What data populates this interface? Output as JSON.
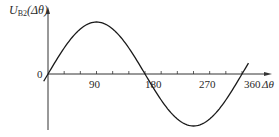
{
  "chart_data": {
    "type": "line",
    "title": "",
    "xlabel": "Δθ",
    "ylabel": "U_B2(Δθ)",
    "ylabel_main": "U",
    "ylabel_sub": "B2",
    "ylabel_arg": "(Δθ)",
    "origin_label": "0",
    "xlim": [
      0,
      360
    ],
    "ylim": [
      -1,
      1
    ],
    "grid": false,
    "legend": null,
    "major_ticks": [
      "90",
      "180",
      "270",
      "360"
    ],
    "minor_tick_step_deg": 30,
    "series": [
      {
        "name": "U_B2(Δθ) = sin(Δθ)",
        "x": [
          0,
          30,
          60,
          90,
          120,
          150,
          180,
          210,
          240,
          270,
          300,
          330,
          360
        ],
        "values": [
          0,
          0.5,
          0.866,
          1,
          0.866,
          0.5,
          0,
          -0.5,
          -0.866,
          -1,
          -0.866,
          -0.5,
          0
        ]
      }
    ]
  },
  "colors": {
    "curve": "#1a1a1a",
    "axis": "#333333",
    "text": "#2a2a2a"
  }
}
